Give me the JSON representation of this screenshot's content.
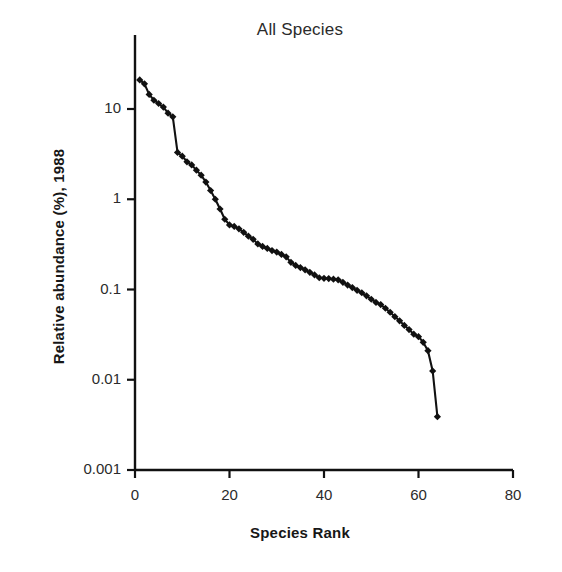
{
  "chart_data": {
    "type": "line",
    "title": "All Species",
    "xlabel": "Species Rank",
    "ylabel": "Relative abundance (%), 1988",
    "xlim": [
      0,
      80
    ],
    "ylim": [
      0.001,
      30
    ],
    "yscale": "log",
    "xscale": "linear",
    "grid": false,
    "legend": null,
    "marker": "filled-diamond",
    "marker_color": "#111111",
    "line_color": "#111111",
    "xticks": [
      0,
      20,
      40,
      60,
      80
    ],
    "xtick_labels": [
      "0",
      "20",
      "40",
      "60",
      "80"
    ],
    "yticks": [
      10,
      1,
      0.1,
      0.01,
      0.001
    ],
    "ytick_labels": [
      "10",
      "1",
      "0.1",
      "0.01",
      "0.001"
    ],
    "series": [
      {
        "name": "All Species",
        "x": [
          1,
          2,
          3,
          4,
          5,
          6,
          7,
          8,
          9,
          10,
          11,
          12,
          13,
          14,
          15,
          16,
          17,
          18,
          19,
          20,
          21,
          22,
          23,
          24,
          25,
          26,
          27,
          28,
          29,
          30,
          31,
          32,
          33,
          34,
          35,
          36,
          37,
          38,
          39,
          40,
          41,
          42,
          43,
          44,
          45,
          46,
          47,
          48,
          49,
          50,
          51,
          52,
          53,
          54,
          55,
          56,
          57,
          58,
          59,
          60,
          61,
          62,
          63,
          64
        ],
        "values": [
          21.0,
          19.0,
          14.5,
          12.5,
          11.5,
          10.5,
          9.0,
          8.2,
          3.3,
          3.0,
          2.6,
          2.4,
          2.1,
          1.85,
          1.55,
          1.25,
          1.0,
          0.78,
          0.6,
          0.52,
          0.5,
          0.47,
          0.43,
          0.39,
          0.36,
          0.32,
          0.3,
          0.285,
          0.27,
          0.26,
          0.245,
          0.23,
          0.2,
          0.185,
          0.175,
          0.165,
          0.155,
          0.145,
          0.135,
          0.133,
          0.132,
          0.13,
          0.128,
          0.12,
          0.112,
          0.105,
          0.098,
          0.092,
          0.085,
          0.078,
          0.072,
          0.068,
          0.062,
          0.056,
          0.05,
          0.045,
          0.04,
          0.036,
          0.032,
          0.03,
          0.026,
          0.021,
          0.0125,
          0.0039
        ]
      }
    ]
  },
  "axes": {
    "x_tick_labels": [
      "0",
      "20",
      "40",
      "60",
      "80"
    ],
    "y_tick_labels": [
      "10",
      "1",
      "0.1",
      "0.01",
      "0.001"
    ]
  },
  "labels": {
    "title": "All Species",
    "x_axis_title": "Species Rank",
    "y_axis_title": "Relative abundance (%), 1988"
  }
}
